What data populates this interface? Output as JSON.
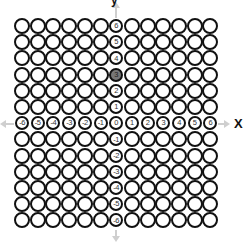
{
  "diagram": {
    "type": "integer coordinate grid of rings",
    "x_axis_label": "X",
    "y_axis_label": "y",
    "x_range": [
      -6,
      6
    ],
    "y_range": [
      -6,
      6
    ],
    "x_axis_numbers": [
      "-6",
      "-5",
      "-4",
      "-3",
      "-2",
      "-1",
      "0",
      "1",
      "2",
      "3",
      "4",
      "5",
      "6"
    ],
    "y_axis_numbers": [
      "6",
      "5",
      "4",
      "3",
      "2",
      "1",
      "0",
      "-1",
      "-2",
      "-3",
      "-4",
      "-5",
      "-6"
    ],
    "highlighted_point": {
      "x": 0,
      "y": 3,
      "label": "3"
    },
    "colors": {
      "ring": "#111111",
      "highlight_fill": "#777777",
      "arrow": "#cfcfcf",
      "background": "#ffffff"
    }
  }
}
